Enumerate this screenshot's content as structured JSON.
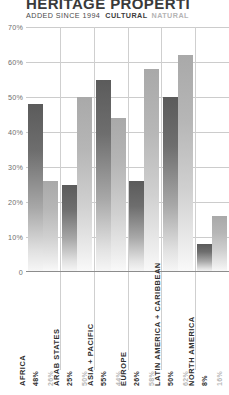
{
  "header": {
    "title": "HERITAGE PROPERTI",
    "added_since": "ADDED SINCE 1994",
    "legend_cultural": "CULTURAL",
    "legend_natural": "NATURAL"
  },
  "colors": {
    "cultural": "#5b5b5b",
    "natural": "#a9a9a9",
    "grid": "#cccccc",
    "axis": "#8c8c8c",
    "text": "#2e2e2e",
    "text_muted": "#b8b8b8"
  },
  "chart_data": {
    "type": "bar",
    "title": "HERITAGE PROPERTI",
    "subtitle": "ADDED SINCE 1994",
    "xlabel": "",
    "ylabel": "",
    "ylim": [
      0,
      70
    ],
    "yticks": [
      "0",
      "10%",
      "20%",
      "30%",
      "40%",
      "50%",
      "60%",
      "70%"
    ],
    "ytick_values": [
      0,
      10,
      20,
      30,
      40,
      50,
      60,
      70
    ],
    "grid": true,
    "legend_position": "top",
    "categories": [
      "AFRICA",
      "ARAB STATES",
      "ASIA + PACIFIC",
      "EUROPE",
      "LATIN AMERICA + CARIBBEAN",
      "NORTH AMERICA"
    ],
    "series": [
      {
        "name": "CULTURAL",
        "values": [
          48,
          25,
          55,
          26,
          50,
          8
        ],
        "labels": [
          "48%",
          "25%",
          "55%",
          "26%",
          "50%",
          "8%"
        ]
      },
      {
        "name": "NATURAL",
        "values": [
          26,
          50,
          44,
          58,
          62,
          16
        ],
        "labels": [
          "26%",
          "50%",
          "44%",
          "58%",
          "62%",
          "16%"
        ]
      }
    ]
  }
}
